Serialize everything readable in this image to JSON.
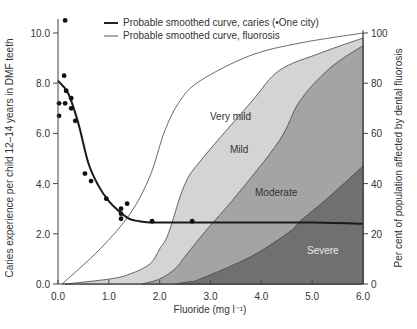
{
  "chart_data": {
    "type": "area",
    "title": "",
    "xlabel": "Fluoride (mg l⁻¹)",
    "ylabel": "Caries experience per child 12–14 years in DMF teeth",
    "ylabel_right": "Per cent of population affected by dental fluorosis",
    "xlim": [
      0,
      6.0
    ],
    "ylim": [
      0,
      10.0
    ],
    "ylim_right": [
      0,
      100
    ],
    "x_ticks": [
      "0.0",
      "1.0",
      "2.0",
      "3.0",
      "4.0",
      "5.0",
      "6.0"
    ],
    "y_ticks": [
      "0.0",
      "2.0",
      "4.0",
      "6.0",
      "8.0",
      "10.0"
    ],
    "y_ticks_right": [
      "0",
      "20",
      "40",
      "60",
      "80",
      "100"
    ],
    "grid": false,
    "legend": [
      {
        "label": "Probable smoothed curve, caries (•One city)",
        "style": "thick"
      },
      {
        "label": "Probable smoothed curve, fluorosis",
        "style": "thin"
      }
    ],
    "legend_position": "top",
    "caries_points": [
      [
        0.14,
        10.5
      ],
      [
        0.12,
        8.3
      ],
      [
        0.16,
        7.7
      ],
      [
        0.02,
        7.2
      ],
      [
        0.26,
        7.4
      ],
      [
        0.14,
        7.2
      ],
      [
        0.26,
        7.0
      ],
      [
        0.02,
        6.7
      ],
      [
        0.34,
        6.5
      ],
      [
        0.53,
        4.4
      ],
      [
        0.65,
        4.1
      ],
      [
        0.95,
        3.4
      ],
      [
        1.36,
        3.2
      ],
      [
        1.24,
        3.0
      ],
      [
        1.24,
        2.8
      ],
      [
        1.24,
        2.6
      ],
      [
        1.85,
        2.5
      ],
      [
        2.64,
        2.5
      ]
    ],
    "caries_curve": {
      "x": [
        0.0,
        0.2,
        0.4,
        0.6,
        0.8,
        1.0,
        1.2,
        1.4,
        1.6,
        1.8,
        2.0,
        3.0,
        4.0,
        5.0,
        6.0
      ],
      "y": [
        8.1,
        7.6,
        6.4,
        4.8,
        3.9,
        3.3,
        2.9,
        2.6,
        2.5,
        2.45,
        2.45,
        2.45,
        2.45,
        2.45,
        2.4
      ]
    },
    "series": [
      {
        "name": "Very mild",
        "color": "#ffffff",
        "x": [
          0.08,
          0.83,
          1.42,
          1.81,
          2.1,
          2.4,
          2.8,
          3.78,
          4.76,
          6.0
        ],
        "y": [
          0,
          14,
          28,
          43,
          61,
          73,
          81,
          91,
          96,
          100
        ]
      },
      {
        "name": "Mild",
        "color": "#d4d4d4",
        "x": [
          0.14,
          1.02,
          1.42,
          1.81,
          2.0,
          2.17,
          2.48,
          2.8,
          3.78,
          4.35,
          5.16,
          6.0
        ],
        "y": [
          0,
          2,
          4,
          8,
          14,
          20,
          39,
          49,
          72,
          85,
          92,
          98
        ]
      },
      {
        "name": "Moderate",
        "color": "#a4a4a4",
        "x": [
          1.65,
          2.0,
          2.3,
          2.5,
          2.9,
          3.5,
          4.35,
          4.76,
          5.35,
          6.0
        ],
        "y": [
          0,
          2,
          6,
          11,
          21,
          35,
          57,
          73,
          86,
          95
        ]
      },
      {
        "name": "Severe",
        "color": "#707070",
        "x": [
          2.3,
          2.6,
          2.8,
          3.8,
          4.57,
          4.76,
          5.35,
          6.0
        ],
        "y": [
          0,
          1,
          2,
          11,
          21,
          25,
          35,
          47
        ]
      }
    ],
    "annotations": [
      "Very mild",
      "Mild",
      "Moderate",
      "Severe"
    ]
  },
  "labels": {
    "very_mild": "Very mild",
    "mild": "Mild",
    "moderate": "Moderate",
    "severe": "Severe"
  }
}
